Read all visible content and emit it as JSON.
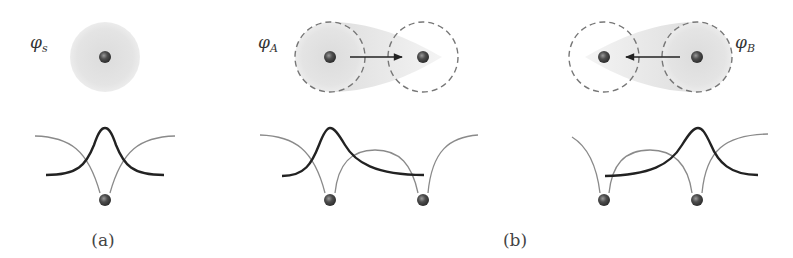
{
  "figure": {
    "panels": [
      {
        "id": "a",
        "caption": "(a)",
        "orbital_label_main": "φ",
        "orbital_label_sub": "s",
        "description": "single atom with s orbital and its wavefunction above the atomic potential well"
      },
      {
        "id": "b",
        "caption": "(b)",
        "sub_panels": [
          {
            "orbital_label_main": "φ",
            "orbital_label_sub": "A",
            "arrow_direction": "right",
            "description": "orbital localized on left atom A, hopping toward atom B"
          },
          {
            "orbital_label_main": "φ",
            "orbital_label_sub": "B",
            "arrow_direction": "left",
            "description": "orbital localized on right atom B, hopping toward atom A"
          }
        ]
      }
    ],
    "colors": {
      "orbital_fill": "#e3e3e3",
      "dashed_circle": "#777777",
      "atom": "#4a4a4a",
      "wavefunction": "#222222",
      "potential": "#8a8a8a"
    }
  }
}
